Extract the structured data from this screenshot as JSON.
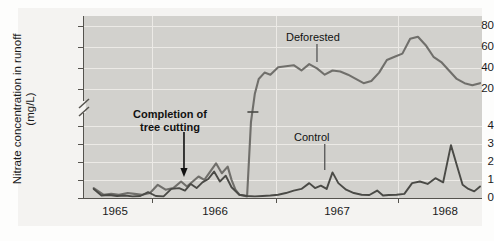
{
  "chart_data": {
    "type": "line",
    "title": "",
    "xlabel": "",
    "ylabel": "Nitrate concentration in runoff (mg/L)",
    "ylabel_line1": "Nitrate concentration in runoff",
    "ylabel_line2": "(mg/L)",
    "grid": true,
    "legend_position": "inline-annotations",
    "axis_break": {
      "present": true,
      "between": [
        4,
        20
      ],
      "symbol": "double-slash"
    },
    "y_ticks": [
      0,
      1,
      2,
      3,
      4,
      20,
      40,
      60,
      80
    ],
    "y_tick_labels": [
      "0",
      "1",
      "2",
      "3",
      "4",
      "20",
      "40",
      "60",
      "80"
    ],
    "ylim_lower_segment": [
      0,
      4.6
    ],
    "ylim_upper_segment": [
      14,
      88
    ],
    "x_tick_labels": [
      "1965",
      "1966",
      "1967",
      "1968"
    ],
    "x_ticks_years": [
      1965,
      1966,
      1967,
      1968
    ],
    "xlim": [
      1964.5,
      1968.6
    ],
    "annotations": [
      {
        "text": "Completion of tree cutting",
        "line1": "Completion of",
        "line2": "tree cutting",
        "style": "bold",
        "arrow": "down",
        "points_to_year": 1965.55
      },
      {
        "text": "Deforested",
        "style": "regular",
        "leader": "down",
        "points_to_year": 1966.95
      },
      {
        "text": "Control",
        "style": "regular",
        "leader": "down",
        "points_to_year": 1967.0
      }
    ],
    "series": [
      {
        "name": "Deforested",
        "color": "#706f6b",
        "x": [
          1964.6,
          1964.7,
          1964.78,
          1964.86,
          1964.95,
          1965.02,
          1965.1,
          1965.18,
          1965.26,
          1965.34,
          1965.42,
          1965.5,
          1965.56,
          1965.62,
          1965.68,
          1965.74,
          1965.8,
          1965.86,
          1965.92,
          1965.98,
          1966.02,
          1966.06,
          1966.1,
          1966.14,
          1966.18,
          1966.22,
          1966.26,
          1966.3,
          1966.36,
          1966.42,
          1966.5,
          1966.58,
          1966.66,
          1966.74,
          1966.82,
          1966.9,
          1966.98,
          1967.06,
          1967.14,
          1967.22,
          1967.3,
          1967.38,
          1967.46,
          1967.54,
          1967.62,
          1967.7,
          1967.78,
          1967.86,
          1967.94,
          1968.02,
          1968.1,
          1968.18,
          1968.26,
          1968.34,
          1968.42,
          1968.5,
          1968.58
        ],
        "y": [
          0.6,
          0.2,
          0.25,
          0.2,
          0.3,
          0.25,
          0.2,
          0.3,
          0.8,
          0.5,
          0.6,
          1.0,
          0.7,
          1.0,
          1.3,
          1.1,
          1.6,
          2.1,
          1.5,
          1.9,
          1.1,
          0.5,
          0.2,
          0.15,
          0.1,
          4.6,
          20,
          34,
          40,
          38,
          45,
          46,
          47,
          42,
          48,
          44,
          38,
          42,
          41,
          38,
          34,
          30,
          32,
          40,
          52,
          55,
          58,
          72,
          74,
          66,
          55,
          50,
          42,
          34,
          30,
          28,
          30
        ]
      },
      {
        "name": "Control",
        "color": "#4a4a46",
        "x": [
          1964.6,
          1964.68,
          1964.76,
          1964.84,
          1964.92,
          1965.0,
          1965.08,
          1965.16,
          1965.24,
          1965.32,
          1965.4,
          1965.48,
          1965.54,
          1965.6,
          1965.66,
          1965.72,
          1965.78,
          1965.84,
          1965.9,
          1965.96,
          1966.02,
          1966.1,
          1966.18,
          1966.26,
          1966.34,
          1966.42,
          1966.5,
          1966.58,
          1966.66,
          1966.74,
          1966.82,
          1966.88,
          1966.94,
          1967.0,
          1967.06,
          1967.12,
          1967.2,
          1967.28,
          1967.36,
          1967.44,
          1967.52,
          1967.58,
          1967.64,
          1967.72,
          1967.8,
          1967.88,
          1967.96,
          1968.04,
          1968.12,
          1968.2,
          1968.28,
          1968.34,
          1968.4,
          1968.46,
          1968.52,
          1968.58
        ],
        "y": [
          0.55,
          0.15,
          0.18,
          0.12,
          0.15,
          0.1,
          0.12,
          0.35,
          0.12,
          0.1,
          0.55,
          0.6,
          0.45,
          0.85,
          0.6,
          0.95,
          1.15,
          1.6,
          1.0,
          1.35,
          0.65,
          0.2,
          0.12,
          0.1,
          0.12,
          0.15,
          0.2,
          0.3,
          0.45,
          0.55,
          0.9,
          0.6,
          0.75,
          0.55,
          1.55,
          0.9,
          0.5,
          0.3,
          0.2,
          0.18,
          0.45,
          0.15,
          0.18,
          0.2,
          0.25,
          0.9,
          1.0,
          0.85,
          1.2,
          0.95,
          3.2,
          2.0,
          0.8,
          0.55,
          0.4,
          0.7
        ]
      }
    ]
  },
  "axis": {
    "y_labels": [
      "80",
      "60",
      "40",
      "20",
      "4",
      "3",
      "2",
      "1",
      "0"
    ],
    "x_labels": [
      "1965",
      "1966",
      "1967",
      "1968"
    ]
  },
  "labels": {
    "y_title_line1": "Nitrate concentration in runoff",
    "y_title_line2": "(mg/L)",
    "ann_cut_line1": "Completion of",
    "ann_cut_line2": "tree cutting",
    "ann_deforested": "Deforested",
    "ann_control": "Control"
  },
  "colors": {
    "panel_bg": "#d2d1cd",
    "figure_bg": "#f4f3f1",
    "grid": "#eceae6",
    "axis": "#55534e",
    "deforested_line": "#706f6b",
    "control_line": "#4a4a46",
    "text": "#1a1a1a"
  }
}
